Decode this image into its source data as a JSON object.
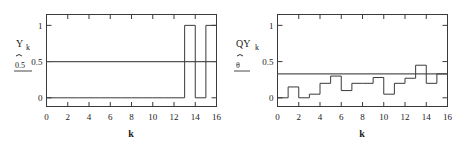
{
  "figure": {
    "background": "#ffffff",
    "stroke_color": "#3a3a3a",
    "reference_line_color": "#555555"
  },
  "chart_data": [
    {
      "id": "left",
      "type": "line",
      "title": "",
      "series_label": "Y",
      "series_subscript": "k",
      "annotation": "0.5",
      "xlabel": "k",
      "ylabel": "",
      "xlim": [
        0,
        16
      ],
      "ylim": [
        -0.12,
        1.15
      ],
      "xticks": [
        0,
        2,
        4,
        6,
        8,
        10,
        12,
        14,
        16
      ],
      "xticklabels": [
        "0",
        "2",
        "4",
        "6",
        "8",
        "10",
        "12",
        "14",
        "16"
      ],
      "yticks": [
        0,
        0.5,
        1
      ],
      "yticklabels": [
        "0",
        "0.5",
        "1"
      ],
      "grid": false,
      "legend": "none",
      "reference_line": 0.5,
      "step_edges": [
        0,
        1,
        2,
        3,
        4,
        5,
        6,
        7,
        8,
        9,
        10,
        11,
        12,
        13,
        14,
        15,
        16
      ],
      "values": [
        0,
        0,
        0,
        0,
        0,
        0,
        0,
        0,
        0,
        0,
        0,
        0,
        0,
        1,
        0,
        1
      ]
    },
    {
      "id": "right",
      "type": "line",
      "title": "",
      "series_label": "QY",
      "series_subscript": "k",
      "annotation": "θ",
      "xlabel": "k",
      "ylabel": "",
      "xlim": [
        0,
        16
      ],
      "ylim": [
        -0.12,
        1.15
      ],
      "xticks": [
        0,
        2,
        4,
        6,
        8,
        10,
        12,
        14,
        16
      ],
      "xticklabels": [
        "0",
        "2",
        "4",
        "6",
        "8",
        "10",
        "12",
        "14",
        "16"
      ],
      "yticks": [
        0,
        0.5,
        1
      ],
      "yticklabels": [
        "0",
        "0.5",
        "1"
      ],
      "grid": false,
      "legend": "none",
      "reference_line": 0.33,
      "step_edges": [
        0,
        1,
        2,
        3,
        4,
        5,
        6,
        7,
        8,
        9,
        10,
        11,
        12,
        13,
        14,
        15,
        16
      ],
      "values": [
        0.0,
        0.15,
        0.0,
        0.05,
        0.2,
        0.3,
        0.1,
        0.2,
        0.2,
        0.28,
        0.05,
        0.2,
        0.27,
        0.45,
        0.2,
        0.33
      ]
    }
  ]
}
